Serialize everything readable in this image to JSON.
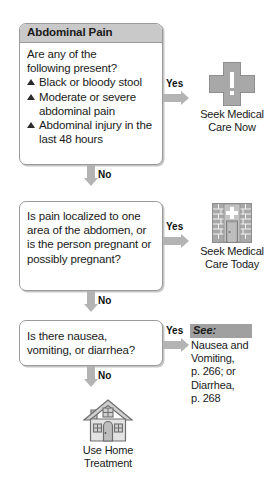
{
  "meta": {
    "topic": "Abdominal Pain decision flowchart",
    "colors": {
      "box_border": "#9a9a9a",
      "header_fill": "#c9c9c9",
      "arrow_gray": "#b4b4b4",
      "icon_gray": "#a8a8a8",
      "see_header_fill": "#a0a0a0",
      "text": "#1a1a1a",
      "page_background": "#ffffff"
    }
  },
  "nodes": [
    {
      "id": "question-1",
      "header": "Abdominal Pain",
      "intro": "Are any of the\nfollowing present?",
      "bullets": [
        "Black or bloody stool",
        "Moderate or severe abdominal pain",
        "Abdominal injury in the last 48 hours"
      ],
      "yes_label": "Yes",
      "no_label": "No"
    },
    {
      "id": "question-2",
      "header": "",
      "intro": "Is pain localized to one area of the abdomen, or is the person pregnant or possibly pregnant?",
      "bullets": [],
      "yes_label": "Yes",
      "no_label": "No"
    },
    {
      "id": "question-3",
      "header": "",
      "intro": "Is there nausea,\nvomiting, or diarrhea?",
      "bullets": [],
      "yes_label": "Yes",
      "no_label": "No"
    }
  ],
  "outcomes": [
    {
      "id": "outcome-seek-now",
      "icon": "medical-cross-alert-icon",
      "label": "Seek Medical\nCare Now"
    },
    {
      "id": "outcome-seek-today",
      "icon": "clinic-building-icon",
      "label": "Seek Medical\nCare Today"
    },
    {
      "id": "outcome-home-treatment",
      "icon": "home-icon",
      "label": "Use Home\nTreatment"
    }
  ],
  "see_also": {
    "id": "see-also-callout",
    "header": "See:",
    "body": "Nausea and\nVomiting,\np. 266; or\nDiarrhea,\np. 268"
  }
}
